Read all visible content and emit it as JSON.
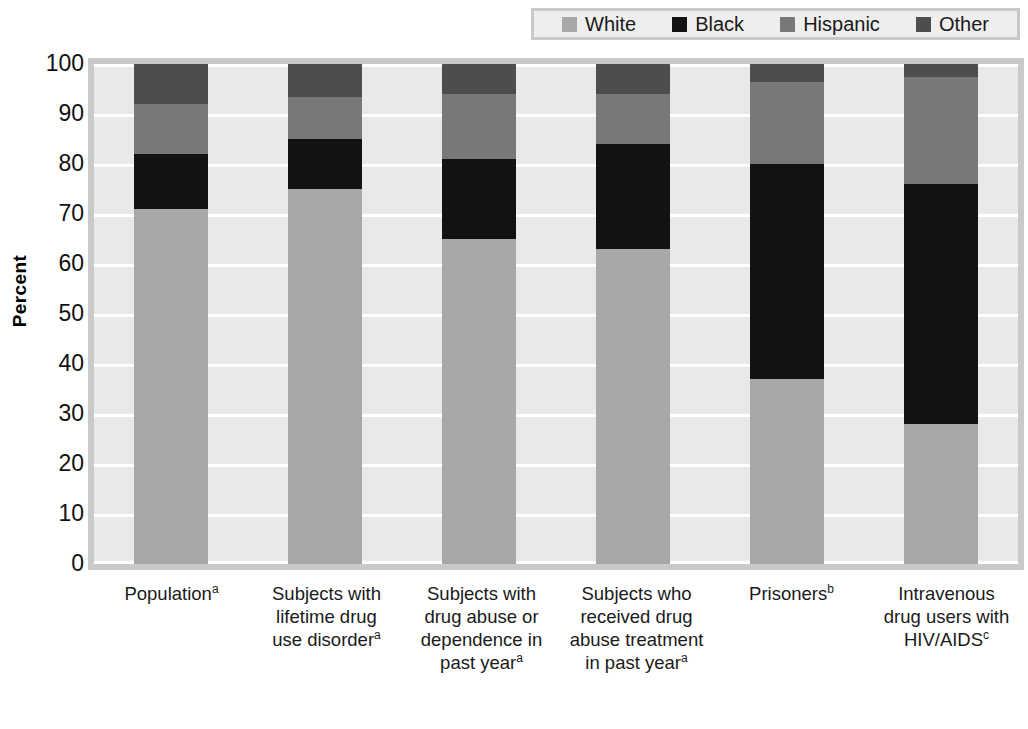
{
  "legend": {
    "position": "top-right",
    "entries": [
      {
        "label": "White",
        "color": "#a8a8a8"
      },
      {
        "label": "Black",
        "color": "#121212"
      },
      {
        "label": "Hispanic",
        "color": "#787878"
      },
      {
        "label": "Other",
        "color": "#4d4d4d"
      }
    ]
  },
  "axis": {
    "y_title": "Percent",
    "y_ticks": [
      "100",
      "90",
      "80",
      "70",
      "60",
      "50",
      "40",
      "30",
      "20",
      "10",
      "0"
    ]
  },
  "categories_display": [
    {
      "text": "Population",
      "sup": "a"
    },
    {
      "text": "Subjects with lifetime drug use disorder",
      "sup": "a"
    },
    {
      "text": "Subjects with drug abuse or dependence in past year",
      "sup": "a"
    },
    {
      "text": "Subjects who received drug abuse treatment in past year",
      "sup": "a"
    },
    {
      "text": "Prisoners",
      "sup": "b"
    },
    {
      "text": "Intravenous drug users with HIV/AIDS",
      "sup": "c"
    }
  ],
  "chart_data": {
    "type": "bar",
    "subtype": "stacked-100",
    "title": "",
    "xlabel": "",
    "ylabel": "Percent",
    "ylim": [
      0,
      100
    ],
    "ytick_step": 10,
    "grid": true,
    "legend_position": "top-right",
    "stack_order_bottom_to_top": [
      "White",
      "Black",
      "Hispanic",
      "Other"
    ],
    "categories": [
      "Population",
      "Subjects with lifetime drug use disorder",
      "Subjects with drug abuse or dependence in past year",
      "Subjects who received drug abuse treatment in past year",
      "Prisoners",
      "Intravenous drug users with HIV/AIDS"
    ],
    "series": [
      {
        "name": "White",
        "color": "#a8a8a8",
        "values": [
          71,
          75,
          65,
          63,
          37,
          28
        ]
      },
      {
        "name": "Black",
        "color": "#121212",
        "values": [
          11,
          10,
          16,
          21,
          43,
          48
        ]
      },
      {
        "name": "Hispanic",
        "color": "#787878",
        "values": [
          10,
          8.5,
          13,
          10,
          16.5,
          21.5
        ]
      },
      {
        "name": "Other",
        "color": "#4d4d4d",
        "values": [
          8,
          6.5,
          6,
          6,
          3.5,
          2.5
        ]
      }
    ]
  },
  "colors": {
    "plot_background": "#e9e9e9",
    "frame": "#c9c9c9",
    "gridline": "#ffffff",
    "page_background": "#ffffff"
  }
}
